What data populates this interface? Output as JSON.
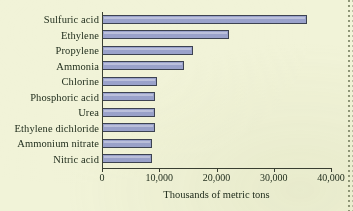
{
  "chart_data": {
    "type": "bar",
    "orientation": "horizontal",
    "title": "",
    "xlabel": "Thousands of metric tons",
    "ylabel": "",
    "xlim": [
      0,
      40000
    ],
    "xticks": [
      0,
      10000,
      20000,
      30000,
      40000
    ],
    "xtick_labels": [
      "0",
      "10,000",
      "20,000",
      "30,000",
      "40,000"
    ],
    "grid": false,
    "legend": false,
    "categories": [
      "Sulfuric acid",
      "Ethylene",
      "Propylene",
      "Ammonia",
      "Chlorine",
      "Phosphoric acid",
      "Urea",
      "Ethylene dichloride",
      "Ammonium nitrate",
      "Nitric acid"
    ],
    "values": [
      35800,
      22200,
      15900,
      14300,
      9600,
      9300,
      9300,
      9300,
      8800,
      8700
    ],
    "bar_color": "#9aa2cb",
    "bar_edge_color": "#3d4352",
    "background_color": "#f1f3d8",
    "axis_color": "#3a4032",
    "text_color": "#23301f"
  }
}
